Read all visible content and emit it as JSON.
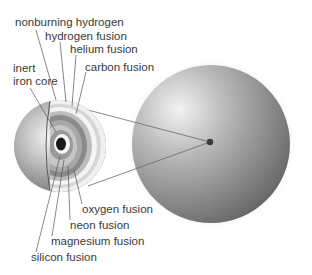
{
  "diagram": {
    "labels": {
      "nonburning_hydrogen": "nonburning hydrogen",
      "hydrogen_fusion": "hydrogen fusion",
      "helium_fusion": "helium fusion",
      "carbon_fusion": "carbon fusion",
      "inert_line1": "inert",
      "inert_line2": "iron core",
      "oxygen_fusion": "oxygen fusion",
      "neon_fusion": "neon fusion",
      "magnesium_fusion": "magnesium fusion",
      "silicon_fusion": "silicon fusion"
    },
    "layers_outer_to_inner": [
      "nonburning hydrogen",
      "hydrogen fusion",
      "helium fusion",
      "carbon fusion",
      "oxygen fusion",
      "neon fusion",
      "magnesium fusion",
      "silicon fusion",
      "inert iron core"
    ],
    "colors": {
      "background": "#ffffff",
      "text": "#3a3a3a",
      "leader_line": "#555555",
      "sphere_light": "#e6e6e6",
      "sphere_dark": "#6e6e6e",
      "core": "#1a1a1a"
    }
  }
}
